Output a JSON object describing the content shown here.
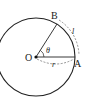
{
  "diagram": {
    "type": "circle-arc-sector",
    "labels": {
      "center": "O",
      "point_a": "A",
      "point_b": "B",
      "angle": "θ",
      "radius": "r",
      "arc_length": "l"
    },
    "colors": {
      "stroke": "#222222",
      "dashed": "#666666",
      "background": "#ffffff"
    }
  }
}
